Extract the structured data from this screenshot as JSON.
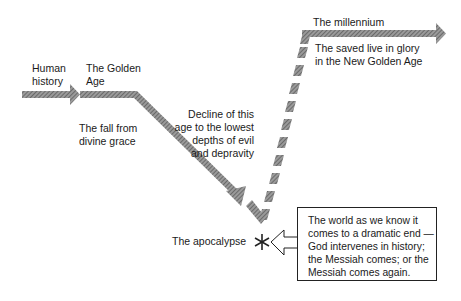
{
  "labels": {
    "human_history": [
      "Human",
      "history"
    ],
    "golden_age": [
      "The Golden",
      "Age"
    ],
    "fall": [
      "The fall from",
      "divine grace"
    ],
    "decline": [
      "Decline of this",
      "age to the lowest",
      "depths of evil",
      "and depravity"
    ],
    "apocalypse": "The apocalypse",
    "millennium": "The millennium",
    "saved": [
      "The saved live in glory",
      "in the New Golden Age"
    ]
  },
  "callout": {
    "lines": [
      "The world as we know it",
      "comes to a dramatic end —",
      "God intervenes in history;",
      "the Messiah comes; or the",
      "Messiah comes again."
    ]
  },
  "symbols": {
    "apocalypse_marker": "asterisk-icon"
  },
  "colors": {
    "arrow_fill": "#8a8a8a",
    "arrow_dark": "#5a5a5a",
    "text": "#1a1a1a",
    "border": "#222222"
  }
}
